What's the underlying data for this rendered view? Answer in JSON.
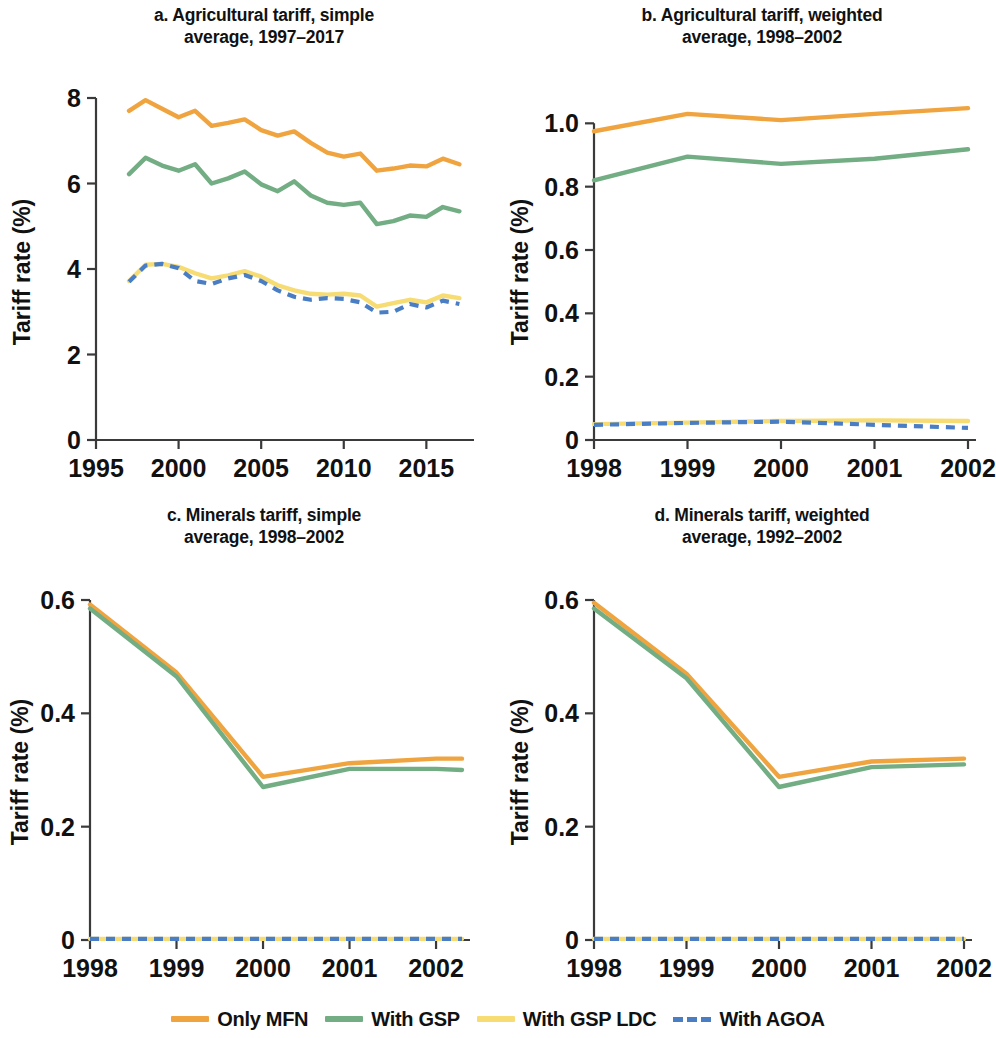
{
  "colors": {
    "mfn": "#f0a43f",
    "gsp": "#72ad83",
    "gsp_ldc": "#f7dc74",
    "agoa": "#4a7ec4",
    "axis": "#3a3a3a",
    "text": "#111111"
  },
  "legend": {
    "items": [
      {
        "label": "Only MFN",
        "color_key": "mfn",
        "style": "solid"
      },
      {
        "label": "With GSP",
        "color_key": "gsp",
        "style": "solid"
      },
      {
        "label": "With GSP LDC",
        "color_key": "gsp_ldc",
        "style": "solid"
      },
      {
        "label": "With AGOA",
        "color_key": "agoa",
        "style": "dashed"
      }
    ]
  },
  "chart_data": [
    {
      "id": "a",
      "type": "line",
      "title": "a. Agricultural tariff, simple average, 1997–2017",
      "title_line1": "a. Agricultural tariff, simple",
      "title_line2": "average, 1997–2017",
      "xlabel": "",
      "ylabel": "Tariff rate (%)",
      "xlim": [
        1995,
        2017.4
      ],
      "ylim": [
        0,
        8
      ],
      "xticks": [
        1995,
        2000,
        2005,
        2010,
        2015
      ],
      "xticklabels": [
        "1995",
        "2000",
        "2005",
        "2010",
        "2015"
      ],
      "yticks": [
        0,
        2,
        4,
        6,
        8
      ],
      "yticklabels": [
        "0",
        "2",
        "4",
        "6",
        "8"
      ],
      "grid": false,
      "legend_position": "below-figure",
      "x": [
        1997,
        1998,
        1999,
        2000,
        2001,
        2002,
        2003,
        2004,
        2005,
        2006,
        2007,
        2008,
        2009,
        2010,
        2011,
        2012,
        2013,
        2014,
        2015,
        2016,
        2017
      ],
      "series": [
        {
          "name": "Only MFN",
          "color_key": "mfn",
          "style": "solid",
          "values": [
            7.7,
            7.95,
            7.75,
            7.55,
            7.7,
            7.35,
            7.42,
            7.5,
            7.25,
            7.12,
            7.22,
            6.95,
            6.72,
            6.63,
            6.7,
            6.3,
            6.35,
            6.42,
            6.4,
            6.58,
            6.45
          ]
        },
        {
          "name": "With GSP",
          "color_key": "gsp",
          "style": "solid",
          "values": [
            6.22,
            6.6,
            6.42,
            6.3,
            6.45,
            6.0,
            6.12,
            6.28,
            5.98,
            5.82,
            6.05,
            5.72,
            5.55,
            5.5,
            5.55,
            5.05,
            5.12,
            5.25,
            5.22,
            5.45,
            5.35
          ]
        },
        {
          "name": "With GSP LDC",
          "color_key": "gsp_ldc",
          "style": "solid",
          "values": [
            3.72,
            4.1,
            4.12,
            4.05,
            3.9,
            3.78,
            3.85,
            3.95,
            3.82,
            3.62,
            3.5,
            3.42,
            3.4,
            3.42,
            3.38,
            3.12,
            3.2,
            3.28,
            3.22,
            3.38,
            3.32
          ]
        },
        {
          "name": "With AGOA",
          "color_key": "agoa",
          "style": "dashed",
          "values": [
            3.7,
            4.08,
            4.12,
            4.02,
            3.72,
            3.65,
            3.78,
            3.86,
            3.72,
            3.5,
            3.35,
            3.28,
            3.32,
            3.3,
            3.22,
            2.98,
            3.0,
            3.18,
            3.1,
            3.26,
            3.18
          ]
        }
      ]
    },
    {
      "id": "b",
      "type": "line",
      "title": "b. Agricultural tariff, weighted average, 1998–2002",
      "title_line1": "b. Agricultural tariff, weighted",
      "title_line2": "average, 1998–2002",
      "xlabel": "",
      "ylabel": "Tariff rate (%)",
      "xlim": [
        1998,
        2002
      ],
      "ylim": [
        0,
        1.08
      ],
      "xticks": [
        1998,
        1999,
        2000,
        2001,
        2002
      ],
      "xticklabels": [
        "1998",
        "1999",
        "2000",
        "2001",
        "2002"
      ],
      "yticks": [
        0,
        0.2,
        0.4,
        0.6,
        0.8,
        1.0
      ],
      "yticklabels": [
        "0",
        "0.2",
        "0.4",
        "0.6",
        "0.8",
        "1.0"
      ],
      "grid": false,
      "legend_position": "below-figure",
      "x": [
        1998,
        1999,
        2000,
        2001,
        2002
      ],
      "series": [
        {
          "name": "Only MFN",
          "color_key": "mfn",
          "style": "solid",
          "values": [
            0.975,
            1.03,
            1.01,
            1.03,
            1.048
          ]
        },
        {
          "name": "With GSP",
          "color_key": "gsp",
          "style": "solid",
          "values": [
            0.82,
            0.895,
            0.872,
            0.888,
            0.918
          ]
        },
        {
          "name": "With GSP LDC",
          "color_key": "gsp_ldc",
          "style": "solid",
          "values": [
            0.05,
            0.055,
            0.06,
            0.062,
            0.06
          ]
        },
        {
          "name": "With AGOA",
          "color_key": "agoa",
          "style": "dashed",
          "values": [
            0.048,
            0.054,
            0.058,
            0.048,
            0.038
          ]
        }
      ]
    },
    {
      "id": "c",
      "type": "line",
      "title": "c. Minerals tariff, simple average, 1998–2002",
      "title_line1": "c. Minerals tariff, simple",
      "title_line2": "average, 1998–2002",
      "xlabel": "",
      "ylabel": "Tariff rate (%)",
      "xlim": [
        1998,
        2002.3
      ],
      "ylim": [
        0,
        0.6
      ],
      "xticks": [
        1998,
        1999,
        2000,
        2001,
        2002
      ],
      "xticklabels": [
        "1998",
        "1999",
        "2000",
        "2001",
        "2002"
      ],
      "yticks": [
        0,
        0.2,
        0.4,
        0.6
      ],
      "yticklabels": [
        "0",
        "0.2",
        "0.4",
        "0.6"
      ],
      "grid": false,
      "legend_position": "below-figure",
      "x": [
        1998,
        1999,
        2000,
        2001,
        2002,
        2002.3
      ],
      "series": [
        {
          "name": "Only MFN",
          "color_key": "mfn",
          "style": "solid",
          "values": [
            0.592,
            0.472,
            0.288,
            0.312,
            0.32,
            0.32
          ]
        },
        {
          "name": "With GSP",
          "color_key": "gsp",
          "style": "solid",
          "values": [
            0.585,
            0.465,
            0.27,
            0.302,
            0.302,
            0.3
          ]
        },
        {
          "name": "With GSP LDC",
          "color_key": "gsp_ldc",
          "style": "solid",
          "values": [
            0.002,
            0.002,
            0.002,
            0.002,
            0.002,
            0.002
          ]
        },
        {
          "name": "With AGOA",
          "color_key": "agoa",
          "style": "dashed",
          "values": [
            0.002,
            0.002,
            0.002,
            0.002,
            0.002,
            0.002
          ]
        }
      ]
    },
    {
      "id": "d",
      "type": "line",
      "title": "d. Minerals tariff, weighted average, 1992–2002",
      "title_line1": "d. Minerals tariff, weighted",
      "title_line2": "average, 1992–2002",
      "xlabel": "",
      "ylabel": "Tariff rate (%)",
      "xlim": [
        1998,
        2002
      ],
      "ylim": [
        0,
        0.6
      ],
      "xticks": [
        1998,
        1999,
        2000,
        2001,
        2002
      ],
      "xticklabels": [
        "1998",
        "1999",
        "2000",
        "2001",
        "2002"
      ],
      "yticks": [
        0,
        0.2,
        0.4,
        0.6
      ],
      "yticklabels": [
        "0",
        "0.2",
        "0.4",
        "0.6"
      ],
      "grid": false,
      "legend_position": "below-figure",
      "x": [
        1998,
        1999,
        2000,
        2001,
        2002
      ],
      "series": [
        {
          "name": "Only MFN",
          "color_key": "mfn",
          "style": "solid",
          "values": [
            0.595,
            0.47,
            0.288,
            0.315,
            0.32
          ]
        },
        {
          "name": "With GSP",
          "color_key": "gsp",
          "style": "solid",
          "values": [
            0.585,
            0.462,
            0.27,
            0.305,
            0.31
          ]
        },
        {
          "name": "With GSP LDC",
          "color_key": "gsp_ldc",
          "style": "solid",
          "values": [
            0.002,
            0.002,
            0.002,
            0.002,
            0.002
          ]
        },
        {
          "name": "With AGOA",
          "color_key": "agoa",
          "style": "dashed",
          "values": [
            0.002,
            0.002,
            0.002,
            0.002,
            0.002
          ]
        }
      ]
    }
  ]
}
